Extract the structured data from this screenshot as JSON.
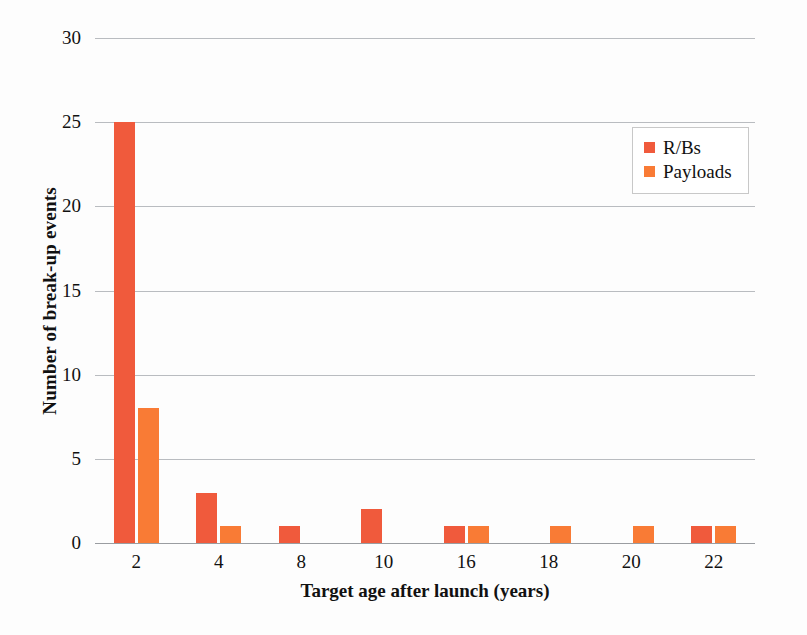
{
  "chart_data": {
    "type": "bar",
    "title": "",
    "xlabel": "Target age after launch (years)",
    "ylabel": "Number of break-up events",
    "categories": [
      "2",
      "4",
      "8",
      "10",
      "16",
      "18",
      "20",
      "22"
    ],
    "series": [
      {
        "name": "R/Bs",
        "color": "#f05a3c",
        "values": [
          25,
          3,
          1,
          2,
          1,
          0,
          0,
          1
        ]
      },
      {
        "name": "Payloads",
        "color": "#f97b35",
        "values": [
          8,
          1,
          0,
          0,
          1,
          1,
          1,
          1
        ]
      }
    ],
    "ylim": [
      0,
      30
    ],
    "yticks": [
      "0",
      "5",
      "10",
      "15",
      "20",
      "25",
      "30"
    ],
    "ytick_values": [
      0,
      5,
      10,
      15,
      20,
      25,
      30
    ],
    "grid": true,
    "legend_position": "top-right",
    "annotations": []
  },
  "legend": {
    "items": [
      {
        "label": "R/Bs",
        "color": "#f05a3c"
      },
      {
        "label": "Payloads",
        "color": "#f97b35"
      }
    ]
  },
  "colors": {
    "rbs": "#f05a3c",
    "payloads": "#f97b35",
    "gridline": "#b9bcc0",
    "axis": "#9a9da1",
    "text": "#111111",
    "background": "#fdfdfd"
  }
}
